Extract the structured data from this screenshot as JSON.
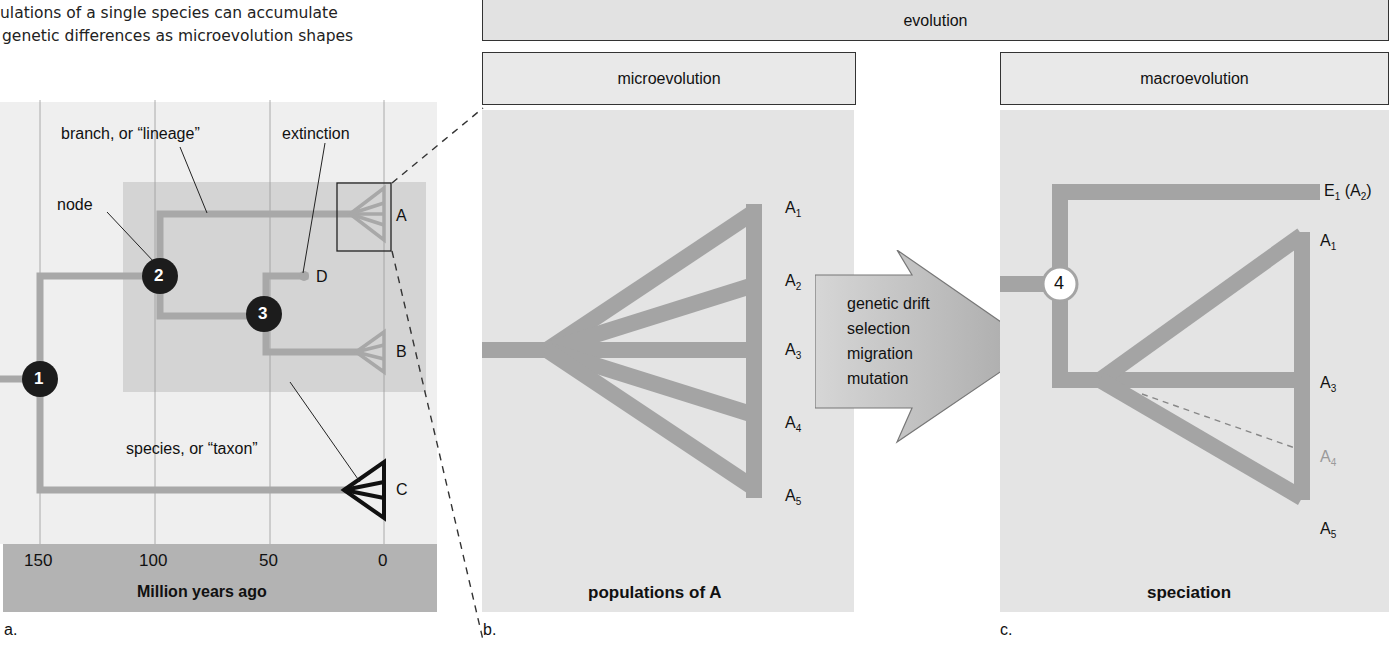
{
  "intro_text": {
    "line1": "ulations of a single species can accumulate",
    "line2": "genetic differences as microevolution shapes"
  },
  "headers": {
    "evolution": "evolution",
    "microevolution": "microevolution",
    "macroevolution": "macroevolution"
  },
  "panel_a": {
    "letter": "a.",
    "annotations": {
      "branch": "branch, or “lineage”",
      "extinction": "extinction",
      "node": "node",
      "species": "species, or “taxon”"
    },
    "nodes": [
      "1",
      "2",
      "3"
    ],
    "taxa": [
      "A",
      "B",
      "C",
      "D"
    ],
    "axis": {
      "ticks": [
        "150",
        "100",
        "50",
        "0"
      ],
      "title": "Million years ago"
    }
  },
  "panel_b": {
    "letter": "b.",
    "populations": [
      "A",
      "A",
      "A",
      "A",
      "A"
    ],
    "subscripts": [
      "1",
      "2",
      "3",
      "4",
      "5"
    ],
    "caption": "populations of A"
  },
  "arrow": {
    "forces": [
      "genetic drift",
      "selection",
      "migration",
      "mutation"
    ]
  },
  "panel_c": {
    "letter": "c.",
    "node": "4",
    "top_label": {
      "main": "E",
      "sub": "1",
      "paren_main": "(A",
      "paren_sub": "2",
      "close": ")"
    },
    "tips": [
      {
        "main": "A",
        "sub": "1",
        "faded": false
      },
      {
        "main": "A",
        "sub": "3",
        "faded": false
      },
      {
        "main": "A",
        "sub": "4",
        "faded": true
      },
      {
        "main": "A",
        "sub": "5",
        "faded": false
      }
    ],
    "caption": "speciation"
  },
  "colors": {
    "branch": "#a8a8a8",
    "node_dark": "#1c1c1c",
    "panel_bg": "#e4e4e4",
    "highlight_bg": "#d2d2d2",
    "axis_bar": "#b3b3b3",
    "faded_label": "#9a9a9a"
  }
}
